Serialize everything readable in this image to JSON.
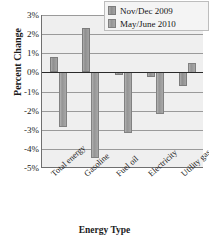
{
  "chart_data": {
    "type": "bar",
    "title": "",
    "xlabel": "Energy Type",
    "ylabel": "Percent Change",
    "categories": [
      "Total energy",
      "Gasoline",
      "Fuel oil",
      "Electricity",
      "Utility gas service"
    ],
    "series": [
      {
        "name": "Nov/Dec 2009",
        "color": "#999999",
        "values": [
          0.8,
          2.3,
          -0.15,
          -0.25,
          -0.75
        ]
      },
      {
        "name": "May/June 2010",
        "color": "#9e9e9e",
        "values": [
          -2.9,
          -4.5,
          -3.2,
          -2.2,
          0.5
        ]
      }
    ],
    "ylim": [
      -5,
      3
    ],
    "ytick_values": [
      3,
      2,
      1,
      0,
      -1,
      -2,
      -3,
      -4,
      -5
    ],
    "ytick_labels": [
      "3%",
      "2%",
      "1%",
      "0%",
      "-1%",
      "-2%",
      "-3%",
      "-4%",
      "-5%"
    ],
    "grid": true,
    "legend_position": "top-right",
    "plot_background": "#efefef"
  }
}
